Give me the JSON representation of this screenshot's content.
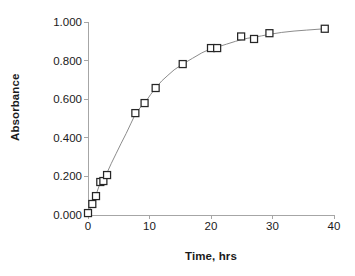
{
  "chart_data": {
    "type": "scatter",
    "title": "",
    "xlabel": "Time, hrs",
    "ylabel": "Absorbance",
    "xlim": [
      0,
      40
    ],
    "ylim": [
      0.0,
      1.0
    ],
    "xticks": [
      0,
      10,
      20,
      30,
      40
    ],
    "yticks": [
      0.0,
      0.2,
      0.4,
      0.6,
      0.8,
      1.0
    ],
    "xtick_labels": [
      "0",
      "10",
      "20",
      "30",
      "40"
    ],
    "ytick_labels": [
      "0.000",
      "0.200",
      "0.400",
      "0.600",
      "0.800",
      "1.000"
    ],
    "grid": false,
    "legend": null,
    "marker_style": "open-square",
    "series": [
      {
        "name": "Absorbance",
        "x": [
          0.0,
          0.7,
          1.3,
          2.0,
          2.5,
          3.1,
          7.7,
          9.2,
          11.0,
          15.4,
          20.0,
          21.0,
          24.9,
          27.0,
          29.5,
          38.5
        ],
        "y": [
          0.01,
          0.057,
          0.098,
          0.171,
          0.176,
          0.207,
          0.528,
          0.58,
          0.658,
          0.782,
          0.865,
          0.865,
          0.925,
          0.912,
          0.942,
          0.965
        ]
      }
    ],
    "fit_curve": {
      "description": "smooth saturating curve through the data points",
      "x": [
        0.0,
        0.6,
        1.2,
        1.8,
        2.4,
        3.0,
        3.8,
        4.6,
        5.4,
        6.2,
        7.0,
        7.8,
        8.6,
        9.4,
        10.2,
        11.0,
        12.0,
        13.0,
        14.0,
        15.4,
        17.0,
        18.5,
        20.0,
        21.0,
        22.5,
        24.0,
        24.9,
        26.0,
        27.0,
        28.2,
        29.5,
        31.5,
        33.5,
        35.5,
        38.5
      ],
      "y": [
        0.01,
        0.052,
        0.095,
        0.15,
        0.182,
        0.212,
        0.268,
        0.32,
        0.372,
        0.422,
        0.476,
        0.53,
        0.56,
        0.588,
        0.625,
        0.658,
        0.695,
        0.724,
        0.752,
        0.782,
        0.812,
        0.84,
        0.862,
        0.87,
        0.885,
        0.9,
        0.908,
        0.916,
        0.921,
        0.928,
        0.936,
        0.946,
        0.953,
        0.958,
        0.965
      ]
    }
  },
  "axes": {
    "y_title": "Absorbance",
    "x_title": "Time, hrs"
  },
  "colors": {
    "marker_stroke": "#262626",
    "marker_fill": "#ffffff",
    "curve": "#8c8c8c",
    "axis": "#a6a6a6",
    "text": "#1a1a1a",
    "background": "#ffffff"
  }
}
